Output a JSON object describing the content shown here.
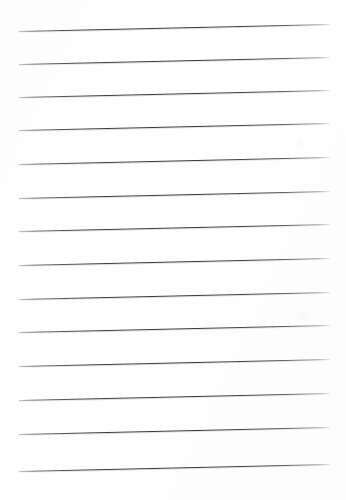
{
  "document": {
    "kind": "lined-paper-scan",
    "description": "Blank ruled notebook page, scanned slightly askew",
    "page_width": 346,
    "page_height": 500,
    "background_color": "#ffffff",
    "paper_tint": "#fdfdfd",
    "rule_color": "#3e3e42",
    "rule_count": 14,
    "rule_thickness": 1,
    "rule_left_x": 19,
    "rule_right_x": 330,
    "rule_length": 311,
    "rule_spacing": 33.5,
    "skew_degrees": -1.3,
    "content_text": ""
  },
  "rules": [
    {
      "index": 1,
      "label": "rule-line-1",
      "left_y": 31,
      "right_y": 24
    },
    {
      "index": 2,
      "label": "rule-line-2",
      "left_y": 64,
      "right_y": 57
    },
    {
      "index": 3,
      "label": "rule-line-3",
      "left_y": 97,
      "right_y": 90
    },
    {
      "index": 4,
      "label": "rule-line-4",
      "left_y": 130,
      "right_y": 123
    },
    {
      "index": 5,
      "label": "rule-line-5",
      "left_y": 164,
      "right_y": 157
    },
    {
      "index": 6,
      "label": "rule-line-6",
      "left_y": 198,
      "right_y": 191
    },
    {
      "index": 7,
      "label": "rule-line-7",
      "left_y": 231,
      "right_y": 224
    },
    {
      "index": 8,
      "label": "rule-line-8",
      "left_y": 265,
      "right_y": 258
    },
    {
      "index": 9,
      "label": "rule-line-9",
      "left_y": 299,
      "right_y": 292
    },
    {
      "index": 10,
      "label": "rule-line-10",
      "left_y": 332,
      "right_y": 325
    },
    {
      "index": 11,
      "label": "rule-line-11",
      "left_y": 366,
      "right_y": 359
    },
    {
      "index": 12,
      "label": "rule-line-12",
      "left_y": 400,
      "right_y": 393
    },
    {
      "index": 13,
      "label": "rule-line-13",
      "left_y": 434,
      "right_y": 427
    },
    {
      "index": 14,
      "label": "rule-line-14",
      "left_y": 471,
      "right_y": 464
    }
  ],
  "artifacts": [
    {
      "label": "scan-smudge-right",
      "x": 303,
      "y": 315,
      "size": 14,
      "opacity": 0.05
    },
    {
      "label": "scan-smudge-upper-right",
      "x": 300,
      "y": 143,
      "size": 12,
      "opacity": 0.04
    }
  ]
}
